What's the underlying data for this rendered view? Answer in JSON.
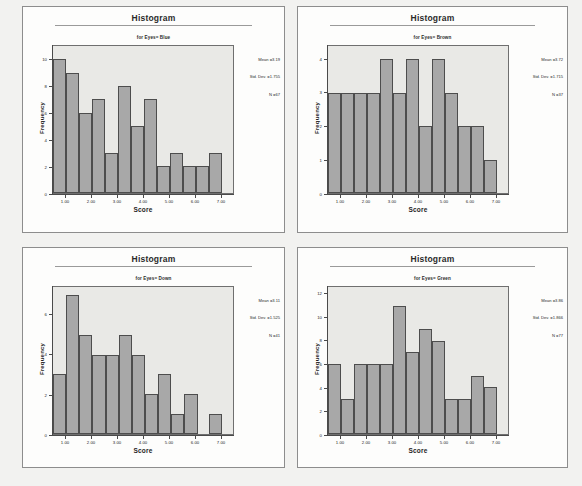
{
  "document": {
    "kind": "scanned-spss-output",
    "background_color": "#f2f2f0",
    "panel_background": "#fdfdfc",
    "plot_background": "#e9e9e6",
    "bar_fill": "#a8a8a8",
    "bar_stroke": "#4d4d4d"
  },
  "chart_data": [
    {
      "id": "blue",
      "type": "bar",
      "title": "Histogram",
      "subtitle": "for Eyes= Blue",
      "xlabel": "Score",
      "ylabel": "Frequency",
      "xlim": [
        0.5,
        7.5
      ],
      "ylim": [
        0,
        11
      ],
      "xticks": [
        "1.00",
        "2.00",
        "3.00",
        "4.00",
        "5.00",
        "6.00",
        "7.00"
      ],
      "xtick_values": [
        1,
        2,
        3,
        4,
        5,
        6,
        7
      ],
      "yticks": [
        "0",
        "2",
        "4",
        "6",
        "8",
        "10"
      ],
      "ytick_values": [
        0,
        2,
        4,
        6,
        8,
        10
      ],
      "grid": false,
      "bin_centers": [
        0.75,
        1.25,
        1.75,
        2.25,
        2.75,
        3.25,
        3.75,
        4.25,
        4.75,
        5.25,
        5.75,
        6.25,
        6.75,
        7.25
      ],
      "values": [
        10,
        9,
        6,
        7,
        3,
        8,
        5,
        7,
        2,
        3,
        2,
        2,
        3,
        0
      ],
      "stats": {
        "mean_label": "Mean =3.19",
        "sd_label": "Std. Dev. =1.755",
        "n_label": "N =67",
        "mean": 3.19,
        "std_dev": 1.755,
        "n": 67
      }
    },
    {
      "id": "brown",
      "type": "bar",
      "title": "Histogram",
      "subtitle": "for Eyes= Brown",
      "xlabel": "Score",
      "ylabel": "Frequency",
      "xlim": [
        0.5,
        7.5
      ],
      "ylim": [
        0,
        4.4
      ],
      "xticks": [
        "1.00",
        "2.00",
        "3.00",
        "4.00",
        "5.00",
        "6.00",
        "7.00"
      ],
      "xtick_values": [
        1,
        2,
        3,
        4,
        5,
        6,
        7
      ],
      "yticks": [
        "0",
        "1",
        "2",
        "3",
        "4"
      ],
      "ytick_values": [
        0,
        1,
        2,
        3,
        4
      ],
      "grid": false,
      "bin_centers": [
        0.75,
        1.25,
        1.75,
        2.25,
        2.75,
        3.25,
        3.75,
        4.25,
        4.75,
        5.25,
        5.75,
        6.25,
        6.75,
        7.25
      ],
      "values": [
        3,
        3,
        3,
        3,
        4,
        3,
        4,
        2,
        4,
        3,
        2,
        2,
        1,
        0
      ],
      "stats": {
        "mean_label": "Mean =3.72",
        "sd_label": "Std. Dev. =1.715",
        "n_label": "N =37",
        "mean": 3.72,
        "std_dev": 1.715,
        "n": 37
      }
    },
    {
      "id": "down",
      "type": "bar",
      "title": "Histogram",
      "subtitle": "for Eyes= Down",
      "xlabel": "Score",
      "ylabel": "Frequency",
      "xlim": [
        0.5,
        7.5
      ],
      "ylim": [
        0,
        7.4
      ],
      "xticks": [
        "1.00",
        "2.00",
        "3.00",
        "4.00",
        "5.00",
        "6.00",
        "7.00"
      ],
      "xtick_values": [
        1,
        2,
        3,
        4,
        5,
        6,
        7
      ],
      "yticks": [
        "0",
        "2",
        "4",
        "6"
      ],
      "ytick_values": [
        0,
        2,
        4,
        6
      ],
      "grid": false,
      "bin_centers": [
        0.75,
        1.25,
        1.75,
        2.25,
        2.75,
        3.25,
        3.75,
        4.25,
        4.75,
        5.25,
        5.75,
        6.25,
        6.75,
        7.25
      ],
      "values": [
        3,
        7,
        5,
        4,
        4,
        5,
        4,
        2,
        3,
        1,
        2,
        0,
        1,
        0
      ],
      "stats": {
        "mean_label": "Mean =3.11",
        "sd_label": "Std. Dev. =1.525",
        "n_label": "N =41",
        "mean": 3.11,
        "std_dev": 1.525,
        "n": 41
      }
    },
    {
      "id": "green",
      "type": "bar",
      "title": "Histogram",
      "subtitle": "for Eyes= Green",
      "xlabel": "Score",
      "ylabel": "Frequency",
      "xlim": [
        0.5,
        7.5
      ],
      "ylim": [
        0,
        12.6
      ],
      "xticks": [
        "1.00",
        "2.00",
        "3.00",
        "4.00",
        "5.00",
        "6.00",
        "7.00"
      ],
      "xtick_values": [
        1,
        2,
        3,
        4,
        5,
        6,
        7
      ],
      "yticks": [
        "0",
        "2",
        "4",
        "6",
        "8",
        "10",
        "12"
      ],
      "ytick_values": [
        0,
        2,
        4,
        6,
        8,
        10,
        12
      ],
      "grid": false,
      "bin_centers": [
        0.75,
        1.25,
        1.75,
        2.25,
        2.75,
        3.25,
        3.75,
        4.25,
        4.75,
        5.25,
        5.75,
        6.25,
        6.75,
        7.25
      ],
      "values": [
        6,
        3,
        6,
        6,
        6,
        11,
        7,
        9,
        8,
        3,
        3,
        5,
        4,
        0
      ],
      "stats": {
        "mean_label": "Mean =3.86",
        "sd_label": "Std. Dev. =1.866",
        "n_label": "N =77",
        "mean": 3.86,
        "std_dev": 1.866,
        "n": 77
      }
    }
  ]
}
